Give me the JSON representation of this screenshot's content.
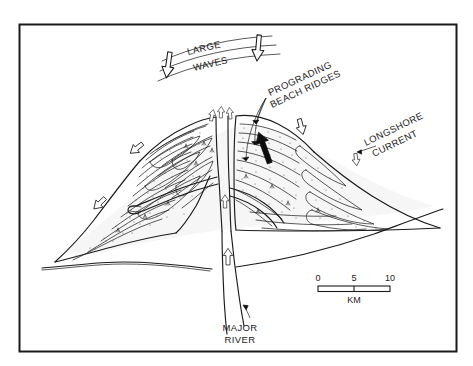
{
  "figure": {
    "kind": "wave-dominated-delta-block-diagram",
    "frame": {
      "x": 19,
      "y": 24,
      "width": 438,
      "height": 328,
      "border_color": "#1b1b1b"
    },
    "background_color": "#ffffff",
    "ink_color": "#1b1b1b"
  },
  "labels": {
    "waves_line1": "LARGE",
    "waves_line2": "WAVES",
    "prograding_line1": "PROGRADING",
    "prograding_line2": "BEACH RIDGES",
    "longshore_line1": "LONGSHORE",
    "longshore_line2": "CURRENT",
    "river_line1": "MAJOR",
    "river_line2": "RIVER"
  },
  "scale_bar": {
    "unit": "KM",
    "ticks": [
      "0",
      "5",
      "10"
    ],
    "min": 0,
    "max": 10,
    "midpoint": 5,
    "bar_x": 318,
    "bar_y": 287,
    "bar_width": 72,
    "bar_height": 5
  },
  "arrows": {
    "wave_arrows": [
      {
        "name": "wave-arrow-left",
        "x": 168,
        "y": 66,
        "angle": 8,
        "style": "hollow",
        "size": 1.0
      },
      {
        "name": "wave-arrow-right",
        "x": 256,
        "y": 50,
        "angle": 5,
        "style": "hollow",
        "size": 1.0
      }
    ],
    "longshore_arrows": [
      {
        "name": "longshore-arrow-upper-left",
        "x": 137,
        "y": 148,
        "angle": 55,
        "style": "hollow",
        "size": 0.78
      },
      {
        "name": "longshore-arrow-lower-left",
        "x": 100,
        "y": 203,
        "angle": 48,
        "style": "hollow",
        "size": 0.78
      },
      {
        "name": "longshore-arrow-right",
        "x": 301,
        "y": 126,
        "angle": -16,
        "style": "hollow",
        "size": 0.78
      },
      {
        "name": "longshore-arrow-far-right",
        "x": 356,
        "y": 158,
        "angle": -8,
        "style": "hollow",
        "size": 0.62
      }
    ],
    "distributary_arrows": [
      {
        "name": "distributary-arrow-a",
        "x": 213,
        "y": 115,
        "angle": 190,
        "style": "hollow",
        "size": 0.55
      },
      {
        "name": "distributary-arrow-b",
        "x": 222,
        "y": 113,
        "angle": 182,
        "style": "hollow",
        "size": 0.55
      },
      {
        "name": "distributary-arrow-c",
        "x": 230,
        "y": 115,
        "angle": 175,
        "style": "hollow",
        "size": 0.55
      }
    ],
    "river_arrow": {
      "name": "river-flow-arrow",
      "x": 226,
      "y": 255,
      "angle": 180,
      "style": "hollow",
      "size": 0.68
    },
    "channel_arrow": {
      "name": "channel-flow-arrow",
      "x": 224,
      "y": 202,
      "angle": 180,
      "style": "hollow",
      "size": 0.55
    },
    "progradation_arrow": {
      "name": "progradation-solid-arrow",
      "x": 264,
      "y": 150,
      "angle": -22,
      "style": "solid",
      "size": 1.0
    }
  },
  "annotations": {
    "prograding_leader_targets": [
      {
        "x": 258,
        "y": 127
      },
      {
        "x": 259,
        "y": 146
      },
      {
        "x": 248,
        "y": 163
      }
    ],
    "longshore_leader_target": {
      "x": 356,
      "y": 153
    },
    "river_leader_target": {
      "x": 244,
      "y": 305
    }
  }
}
